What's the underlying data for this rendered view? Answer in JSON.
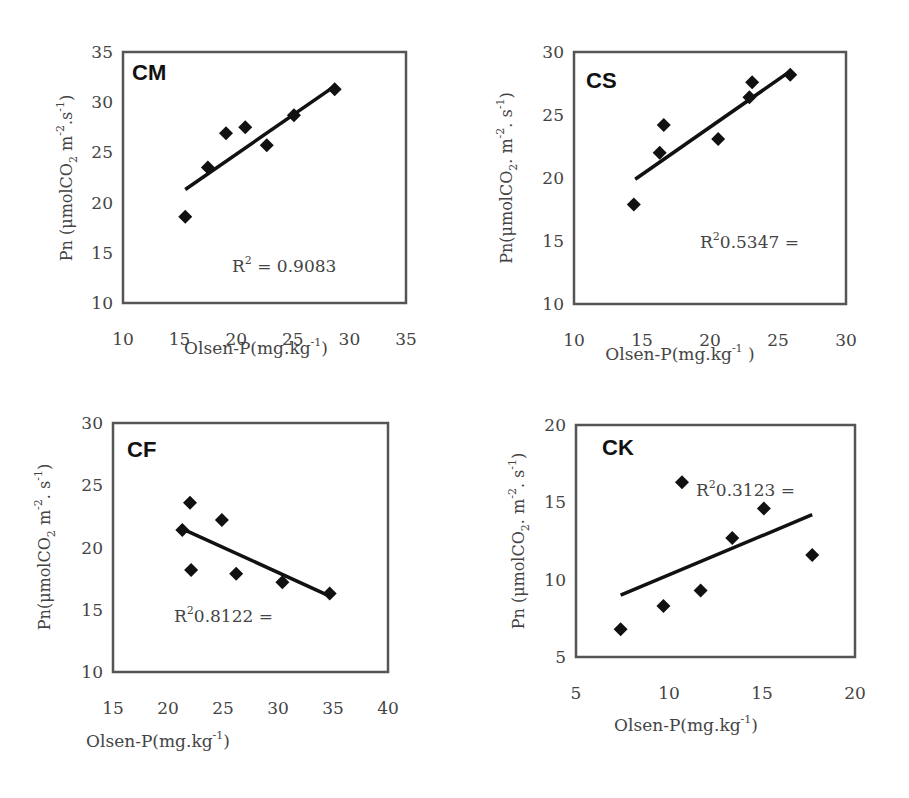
{
  "chart_data": [
    {
      "type": "scatter",
      "title": "CM",
      "xlabel": "Olsen-P(mg.kg-1)",
      "ylabel": "Pn (μmolCO2 m-2.s-1)",
      "xlim": [
        10,
        35
      ],
      "ylim": [
        10,
        35
      ],
      "xticks": [
        10,
        15,
        20,
        25,
        30,
        35
      ],
      "yticks": [
        10,
        15,
        20,
        25,
        30,
        35
      ],
      "grid": false,
      "points": [
        [
          15.5,
          18.6
        ],
        [
          17.5,
          23.5
        ],
        [
          19.1,
          26.9
        ],
        [
          20.8,
          27.5
        ],
        [
          22.7,
          25.7
        ],
        [
          25.1,
          28.7
        ],
        [
          28.7,
          31.3
        ]
      ],
      "trendline": [
        [
          15.5,
          21.3
        ],
        [
          28.7,
          31.6
        ]
      ],
      "annotation": "R² = 0.9083",
      "r2": 0.9083
    },
    {
      "type": "scatter",
      "title": "CS",
      "xlabel": "Olsen-P(mg.kg-1 )",
      "ylabel": "Pn(μmolCO2.m-2.s-1)",
      "xlim": [
        10,
        30
      ],
      "ylim": [
        10,
        30
      ],
      "xticks": [
        10,
        15,
        20,
        25,
        30
      ],
      "yticks": [
        10,
        15,
        20,
        25,
        30
      ],
      "grid": false,
      "points": [
        [
          14.4,
          17.9
        ],
        [
          16.3,
          22.0
        ],
        [
          16.6,
          24.2
        ],
        [
          20.6,
          23.1
        ],
        [
          22.9,
          26.4
        ],
        [
          23.1,
          27.6
        ],
        [
          25.9,
          28.2
        ]
      ],
      "trendline": [
        [
          14.5,
          19.9
        ],
        [
          25.8,
          28.4
        ]
      ],
      "annotation": "R²0.5347 =",
      "r2": 0.5347
    },
    {
      "type": "scatter",
      "title": "CF",
      "xlabel": "Olsen-P(mg.kg-1)",
      "ylabel": "Pn(μmolCO2 m-2.s-1)",
      "xlim": [
        15,
        40
      ],
      "ylim": [
        10,
        30
      ],
      "xticks": [
        15,
        20,
        25,
        30,
        35,
        40
      ],
      "yticks": [
        10,
        15,
        20,
        25,
        30
      ],
      "grid": false,
      "points": [
        [
          21.3,
          21.4
        ],
        [
          22.0,
          23.6
        ],
        [
          22.1,
          18.2
        ],
        [
          24.9,
          22.2
        ],
        [
          26.2,
          17.9
        ],
        [
          30.4,
          17.2
        ],
        [
          34.7,
          16.3
        ]
      ],
      "trendline": [
        [
          21.3,
          21.5
        ],
        [
          34.7,
          16.1
        ]
      ],
      "annotation": "R²0.8122 =",
      "r2": 0.8122
    },
    {
      "type": "scatter",
      "title": "CK",
      "xlabel": "Olsen-P(mg.kg-1)",
      "ylabel": "Pn (μmolCO2.m-2.s-1)",
      "xlim": [
        5,
        20
      ],
      "ylim": [
        5,
        20
      ],
      "xticks": [
        5,
        10,
        15,
        20
      ],
      "yticks": [
        5,
        10,
        15,
        20
      ],
      "grid": false,
      "points": [
        [
          7.4,
          6.8
        ],
        [
          9.7,
          8.3
        ],
        [
          10.7,
          16.3
        ],
        [
          11.7,
          9.3
        ],
        [
          13.4,
          12.7
        ],
        [
          15.1,
          14.6
        ],
        [
          17.7,
          11.6
        ]
      ],
      "trendline": [
        [
          7.4,
          9.0
        ],
        [
          17.7,
          14.2
        ]
      ],
      "annotation": "R²0.3123 =",
      "r2": 0.3123
    }
  ],
  "panels": [
    {
      "label": "CM",
      "r2_prefix": "R",
      "r2_text": " = 0.9083",
      "xlabel": "Olsen-P(mg.kg",
      "xlabel_end": ")",
      "ylabel_pre": "Pn (μmolCO",
      "ylabel_mid": " m",
      "ylabel_post": ".s",
      "ylabel_end": ")"
    },
    {
      "label": "CS",
      "r2_prefix": "R",
      "r2_text": "0.5347 =",
      "xlabel": "Olsen-P(mg.kg",
      "xlabel_end": " )",
      "ylabel_pre": "Pn(μmolCO",
      "ylabel_mid": ". m",
      "ylabel_post": ". s",
      "ylabel_end": ")"
    },
    {
      "label": "CF",
      "r2_prefix": "R",
      "r2_text": "0.8122 =",
      "xlabel": "Olsen-P(mg.kg",
      "xlabel_end": ")",
      "ylabel_pre": "Pn(μmolCO",
      "ylabel_mid": " m",
      "ylabel_post": ". s",
      "ylabel_end": ")"
    },
    {
      "label": "CK",
      "r2_prefix": "R",
      "r2_text": "0.3123 =",
      "xlabel": "Olsen-P(mg.kg",
      "xlabel_end": ")",
      "ylabel_pre": "Pn (μmolCO",
      "ylabel_mid": ". m",
      "ylabel_post": ". s",
      "ylabel_end": ")"
    }
  ],
  "superscripts": {
    "two": "2",
    "minus_one": "-1",
    "minus_two": "-2"
  },
  "colors": {
    "marker": "#111111",
    "line": "#111111",
    "frame": "#555555",
    "text": "#444444"
  }
}
